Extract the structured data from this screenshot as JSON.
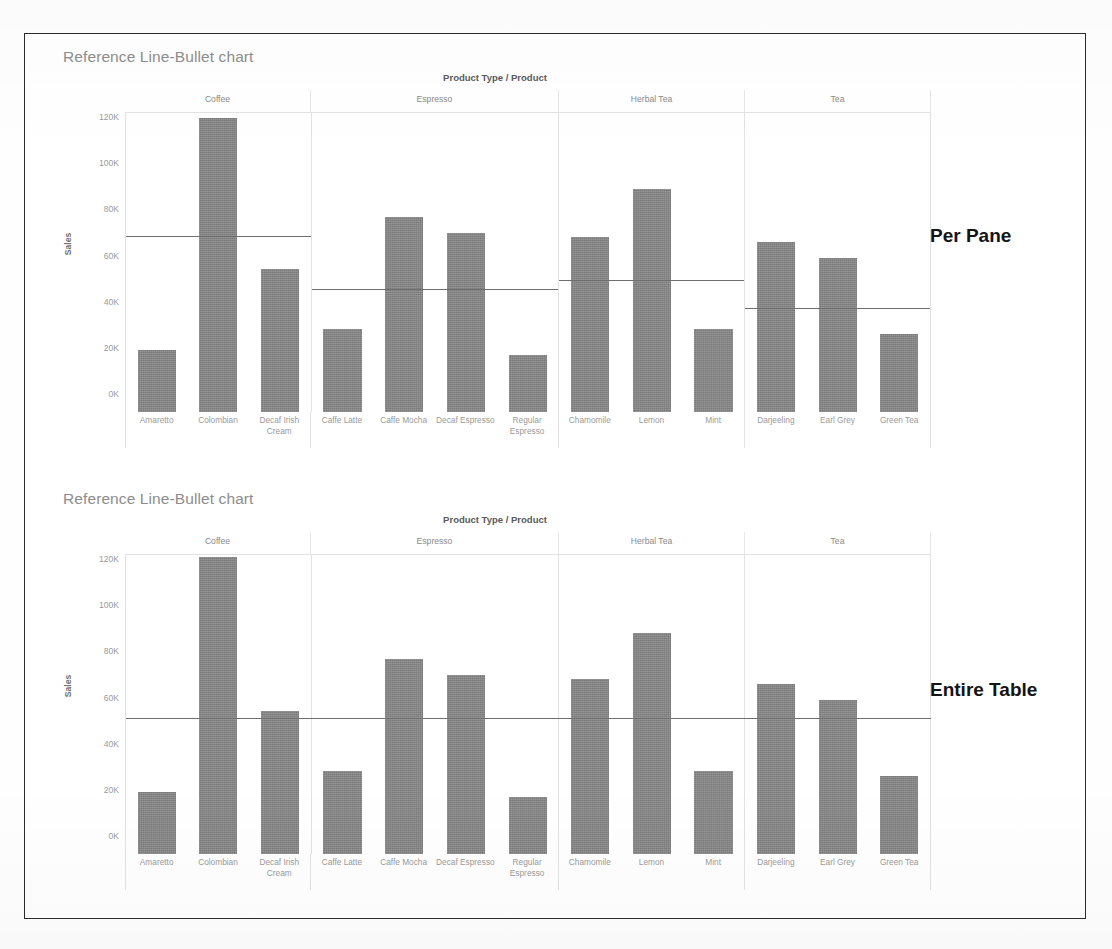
{
  "page": {
    "annotations": [
      {
        "name": "per-pane",
        "label": "Per Pane"
      },
      {
        "name": "entire-table",
        "label": "Entire Table"
      }
    ]
  },
  "panels": [
    {
      "title": "Reference Line-Bullet chart",
      "reference_scope": "Per Pane"
    },
    {
      "title": "Reference Line-Bullet chart",
      "reference_scope": "Entire Table"
    }
  ],
  "chart_data": [
    {
      "type": "bar",
      "title": "Reference Line-Bullet chart",
      "subtitle": "Per Pane",
      "xlabel": "Product Type / Product",
      "ylabel": "Sales",
      "ylim": [
        0,
        130000
      ],
      "yticks": [
        0,
        20000,
        40000,
        60000,
        80000,
        100000,
        120000
      ],
      "ytick_labels": [
        "0K",
        "20K",
        "40K",
        "60K",
        "80K",
        "100K",
        "120K"
      ],
      "grid": false,
      "legend": "none",
      "panes": [
        {
          "name": "Coffee",
          "categories": [
            "Amaretto",
            "Colombian",
            "Decaf Irish Cream"
          ],
          "values": [
            27000,
            128000,
            62000
          ],
          "reference_line": 76000,
          "reference_label": "Average per pane"
        },
        {
          "name": "Espresso",
          "categories": [
            "Caffe Latte",
            "Caffe Mocha",
            "Decaf Espresso",
            "Regular Espresso"
          ],
          "values": [
            36000,
            85000,
            78000,
            25000
          ],
          "reference_line": 53000,
          "reference_label": "Average per pane"
        },
        {
          "name": "Herbal Tea",
          "categories": [
            "Chamomile",
            "Lemon",
            "Mint"
          ],
          "values": [
            76000,
            97000,
            36000
          ],
          "reference_line": 57000,
          "reference_label": "Average per pane"
        },
        {
          "name": "Tea",
          "categories": [
            "Darjeeling",
            "Earl Grey",
            "Green Tea"
          ],
          "values": [
            74000,
            67000,
            34000
          ],
          "reference_line": 45000,
          "reference_label": "Average per pane"
        }
      ]
    },
    {
      "type": "bar",
      "title": "Reference Line-Bullet chart",
      "subtitle": "Entire Table",
      "xlabel": "Product Type / Product",
      "ylabel": "Sales",
      "ylim": [
        0,
        130000
      ],
      "yticks": [
        0,
        20000,
        40000,
        60000,
        80000,
        100000,
        120000
      ],
      "ytick_labels": [
        "0K",
        "20K",
        "40K",
        "60K",
        "80K",
        "100K",
        "120K"
      ],
      "grid": false,
      "legend": "none",
      "table_reference_line": 58500,
      "table_reference_label": "Average entire table",
      "panes": [
        {
          "name": "Coffee",
          "categories": [
            "Amaretto",
            "Colombian",
            "Decaf Irish Cream"
          ],
          "values": [
            27000,
            129000,
            62000
          ]
        },
        {
          "name": "Espresso",
          "categories": [
            "Caffe Latte",
            "Caffe Mocha",
            "Decaf Espresso",
            "Regular Espresso"
          ],
          "values": [
            36000,
            85000,
            78000,
            25000
          ]
        },
        {
          "name": "Herbal Tea",
          "categories": [
            "Chamomile",
            "Lemon",
            "Mint"
          ],
          "values": [
            76000,
            96000,
            36000
          ]
        },
        {
          "name": "Tea",
          "categories": [
            "Darjeeling",
            "Earl Grey",
            "Green Tea"
          ],
          "values": [
            74000,
            67000,
            34000
          ]
        }
      ]
    }
  ],
  "colors": {
    "bar": "#868686",
    "reference_line": "#6e6e6e",
    "grid": "#e2e2e2",
    "title_text": "#8d8d8d",
    "axis_text": "#9a9a9a",
    "annotation_text": "#141414",
    "page_border": "#2b2b2b"
  }
}
